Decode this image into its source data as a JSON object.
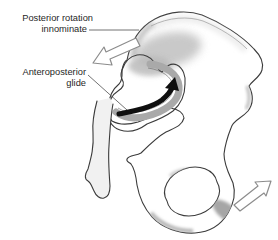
{
  "diagram": {
    "labels": {
      "posterior_rotation": {
        "line1": "Posterior rotation",
        "line2": "innominate"
      },
      "anteroposterior_glide": {
        "line1": "Anteroposterior",
        "line2": "glide"
      }
    },
    "icons": {
      "top_arrow": "posterior-rotation-arrow",
      "joint_arrow": "anteroposterior-glide-arrow",
      "bottom_arrow": "rotation-direction-arrow"
    },
    "colors": {
      "background": "#ffffff",
      "bone_outline": "#3b3b3b",
      "bone_light": "#e9e9e9",
      "bone_dark": "#c0c0c0",
      "auricular_band": "#a9a9a9",
      "black_arrow": "#0f0f0f",
      "white_arrow_fill": "#ffffff",
      "white_arrow_outline": "#8c8c8c",
      "leader_line": "#4f4f4f",
      "text": "#1f1f1f"
    }
  }
}
